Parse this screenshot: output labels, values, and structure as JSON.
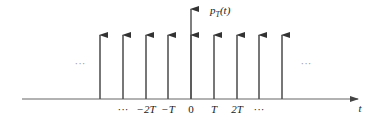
{
  "diagram": {
    "function_label": {
      "base": "p",
      "sub": "T",
      "arg": "(t)"
    },
    "x_axis_label": "t",
    "left_ellipsis": "···",
    "right_ellipsis": "···",
    "tick_labels": [
      "···",
      "−2T",
      "−T",
      "0",
      "T",
      "2T",
      "···"
    ],
    "impulse_count": 9,
    "colors": {
      "line": "#555555",
      "text": "#222222",
      "background": "#ffffff"
    }
  }
}
